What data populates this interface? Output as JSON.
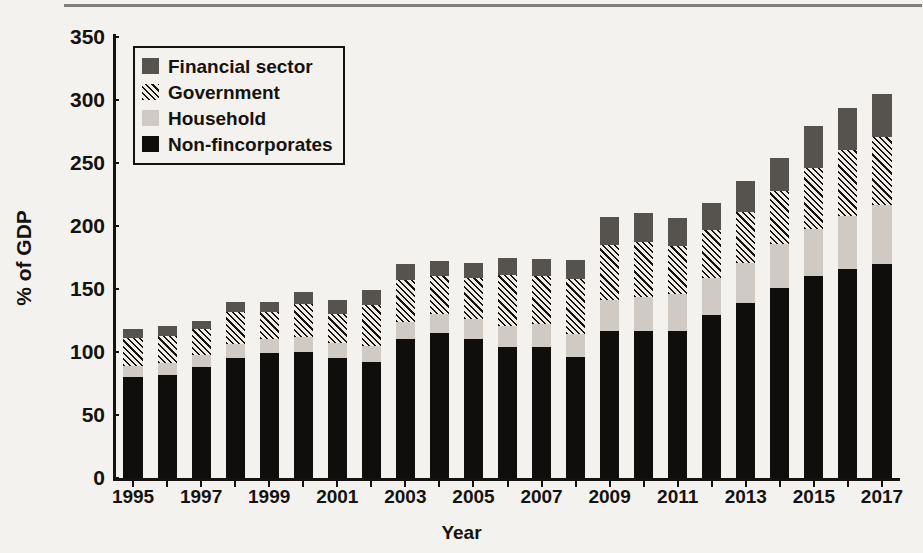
{
  "chart_data": {
    "type": "bar",
    "title": "",
    "subtitle": "",
    "stacked": true,
    "xlabel": "Year",
    "ylabel": "% of GDP",
    "ylim": [
      0,
      350
    ],
    "ytick_step": 50,
    "yticks": [
      0,
      50,
      100,
      150,
      200,
      250,
      300,
      350
    ],
    "grid": false,
    "legend_position": "top-left",
    "categories": [
      "1995",
      "1996",
      "1997",
      "1998",
      "1999",
      "2000",
      "2001",
      "2002",
      "2003",
      "2004",
      "2005",
      "2006",
      "2007",
      "2008",
      "2009",
      "2010",
      "2011",
      "2012",
      "2013",
      "2014",
      "2015",
      "2016",
      "2017"
    ],
    "xtick_labels": [
      "1995",
      "1997",
      "1999",
      "2001",
      "2003",
      "2005",
      "2007",
      "2009",
      "2011",
      "2013",
      "2015",
      "2017"
    ],
    "series": [
      {
        "name": "Non-fincorporates",
        "color": "#100e0c",
        "pattern": "solid-black",
        "values": [
          80,
          82,
          88,
          95,
          99,
          100,
          95,
          92,
          110,
          115,
          110,
          104,
          104,
          96,
          117,
          117,
          117,
          129,
          139,
          151,
          160,
          166,
          170
        ]
      },
      {
        "name": "Household",
        "color": "#cfcbc4",
        "pattern": "solid-light-gray",
        "values": [
          9,
          9,
          10,
          11,
          11,
          12,
          12,
          13,
          14,
          15,
          16,
          17,
          18,
          18,
          24,
          27,
          29,
          30,
          32,
          35,
          38,
          42,
          47
        ]
      },
      {
        "name": "Government",
        "color": "#efece7",
        "pattern": "diagonal-hatch",
        "values": [
          22,
          22,
          20,
          26,
          22,
          26,
          23,
          32,
          33,
          30,
          33,
          40,
          38,
          44,
          44,
          43,
          38,
          38,
          40,
          42,
          48,
          52,
          54
        ]
      },
      {
        "name": "Financial sector",
        "color": "#56534e",
        "pattern": "solid-dark-gray",
        "values": [
          7,
          8,
          7,
          8,
          8,
          10,
          11,
          12,
          13,
          12,
          12,
          14,
          14,
          15,
          22,
          23,
          22,
          21,
          25,
          26,
          33,
          34,
          34
        ]
      }
    ],
    "totals": [
      118,
      121,
      125,
      140,
      140,
      148,
      141,
      149,
      170,
      172,
      171,
      175,
      174,
      173,
      207,
      210,
      206,
      218,
      236,
      254,
      279,
      294,
      305
    ]
  },
  "legend": {
    "items": [
      {
        "label": "Financial sector",
        "swatch": "dark-gray"
      },
      {
        "label": "Government",
        "swatch": "hatched"
      },
      {
        "label": "Household",
        "swatch": "light-gray"
      },
      {
        "label": "Non-fincorporates",
        "swatch": "black"
      }
    ]
  },
  "page_showthrough": {
    "lines": [
      "Federal Reserve raises interest rates and pushes up the value of the dollar,",
      "dollar debts are difficult to pay back and foreign investors flee, creating a",
      "currency crisis. Some policymakers make these two problems worse by pub-",
      "licly stating that their inflation and large dollar-denominated external debt)",
      "would force domestic interest rates at artificially low level in financial",
      "responsive",
      "or the case of a typical emerging-country situation. Unlike other",
      "in that a country does not have to issue external trade debt, it does not",
      "relationship has issues because it will be difficult for them to borrow large",
      "amounts in their own currency and so they must borrow in greater-",
      "national currency. Fragile currency and risks of a crisis give rise to a nega-",
      "tive relationship between monetary policy and credit expansion that provide",
      "high levels of investment in the economy and encourage private savings",
      "of the",
      "countries which suffered banking and financial crisis that led to a combination",
      "of policy buffers."
    ]
  }
}
